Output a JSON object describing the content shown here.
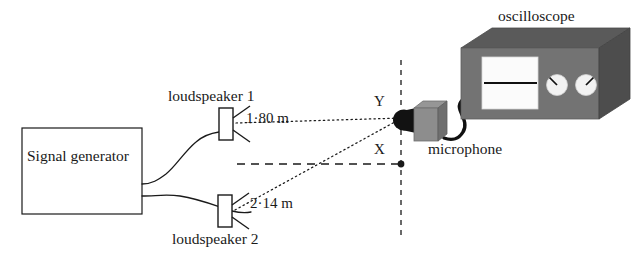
{
  "figure": {
    "type": "physics-apparatus-diagram"
  },
  "labels": {
    "oscilloscope": "oscilloscope",
    "loudspeaker_1": "loudspeaker 1",
    "loudspeaker_2": "loudspeaker 2",
    "microphone": "microphone",
    "signal_generator": "Signal generator",
    "point_y": "Y",
    "point_x": "X"
  },
  "measurements": {
    "distance_speaker1_to_y": "1·80 m",
    "distance_speaker2_to_y": "2·14 m"
  },
  "colors": {
    "stroke": "#1a1a1a",
    "box_top_face": "#5a5a5a",
    "box_front_face": "#737373",
    "box_side_face": "#4a4a4a",
    "screen": "#fbfbfb",
    "knob": "#f2f2f2",
    "mic_head": "#111111",
    "background": "#ffffff"
  },
  "components": [
    {
      "name": "signal-generator",
      "shape": "rectangle"
    },
    {
      "name": "loudspeaker-1",
      "shape": "speaker-cone"
    },
    {
      "name": "loudspeaker-2",
      "shape": "speaker-cone"
    },
    {
      "name": "microphone",
      "shape": "3d-box-with-head"
    },
    {
      "name": "oscilloscope",
      "shape": "3d-box-with-screen-and-knobs"
    }
  ],
  "paths": {
    "speaker1_to_y": "dotted",
    "speaker2_to_y": "dotted",
    "axis_horizontal": "dashed",
    "axis_vertical": "dashed"
  }
}
